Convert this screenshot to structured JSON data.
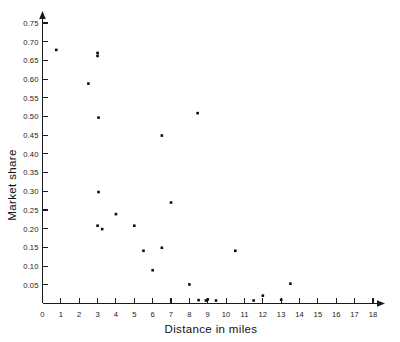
{
  "chart_data": {
    "type": "scatter",
    "title": "",
    "xlabel": "Distance in miles",
    "ylabel": "Market share",
    "xlim": [
      0,
      18.8
    ],
    "ylim": [
      0,
      0.78
    ],
    "grid": false,
    "legend": "none",
    "x_ticks": [
      0,
      1,
      2,
      3,
      4,
      5,
      6,
      7,
      8,
      9,
      10,
      11,
      12,
      13,
      14,
      15,
      16,
      17,
      18
    ],
    "x_tick_labels": [
      "0",
      "1",
      "2",
      "3",
      "4",
      "5",
      "6",
      "7",
      "8",
      "9",
      "10",
      "11",
      "12",
      "13",
      "14",
      "15",
      "16",
      "17",
      "18"
    ],
    "y_ticks": [
      0.05,
      0.1,
      0.15,
      0.2,
      0.25,
      0.3,
      0.35,
      0.4,
      0.45,
      0.5,
      0.55,
      0.6,
      0.65,
      0.7,
      0.75
    ],
    "y_tick_labels": [
      "0.05",
      "0.10",
      "0.15",
      "0.20",
      "0.25",
      "0.30",
      "0.35",
      "0.40",
      "0.45",
      "0.50",
      "0.55",
      "0.60",
      "0.65",
      "0.70",
      "0.75"
    ],
    "marker": "square",
    "marker_color": "#0d0d0d",
    "marker_size_px": 2.6,
    "points": [
      {
        "x": 0.75,
        "y": 0.678
      },
      {
        "x": 2.5,
        "y": 0.588
      },
      {
        "x": 3.0,
        "y": 0.67
      },
      {
        "x": 3.0,
        "y": 0.662
      },
      {
        "x": 3.05,
        "y": 0.497
      },
      {
        "x": 3.05,
        "y": 0.298
      },
      {
        "x": 3.0,
        "y": 0.208
      },
      {
        "x": 3.25,
        "y": 0.199
      },
      {
        "x": 4.0,
        "y": 0.239
      },
      {
        "x": 5.0,
        "y": 0.208
      },
      {
        "x": 5.5,
        "y": 0.141
      },
      {
        "x": 6.0,
        "y": 0.089
      },
      {
        "x": 6.5,
        "y": 0.449
      },
      {
        "x": 6.5,
        "y": 0.149
      },
      {
        "x": 7.0,
        "y": 0.27
      },
      {
        "x": 8.0,
        "y": 0.051
      },
      {
        "x": 8.45,
        "y": 0.509
      },
      {
        "x": 8.5,
        "y": 0.009
      },
      {
        "x": 8.9,
        "y": 0.008
      },
      {
        "x": 9.0,
        "y": 0.011
      },
      {
        "x": 9.45,
        "y": 0.008
      },
      {
        "x": 10.5,
        "y": 0.141
      },
      {
        "x": 11.5,
        "y": 0.008
      },
      {
        "x": 12.0,
        "y": 0.021
      },
      {
        "x": 13.0,
        "y": 0.01
      },
      {
        "x": 13.5,
        "y": 0.053
      }
    ],
    "n_points": 26
  },
  "axes": {
    "y_axis_name": "market-share-axis",
    "x_axis_name": "distance-axis"
  }
}
